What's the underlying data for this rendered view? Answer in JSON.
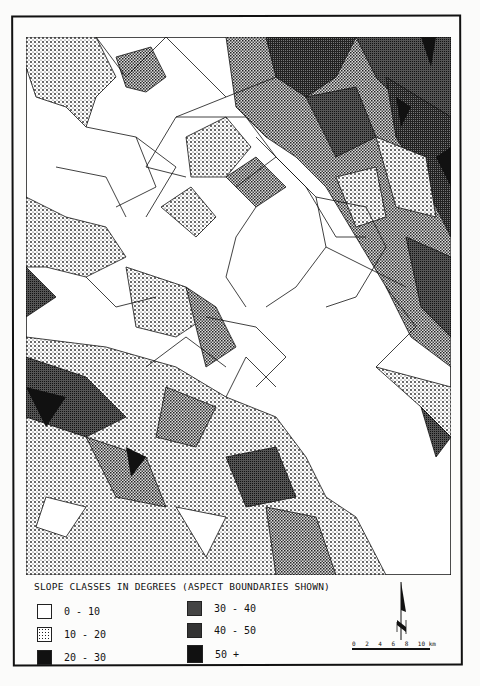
{
  "figure": {
    "type": "slope-class TIN map",
    "legend": {
      "title": "SLOPE CLASSES IN DEGREES",
      "subtitle": "(ASPECT BOUNDARIES SHOWN)",
      "classes": [
        {
          "label": "0 - 10",
          "pattern": "blank"
        },
        {
          "label": "10 - 20",
          "pattern": "light-dots"
        },
        {
          "label": "20 - 30",
          "pattern": "medium-dots"
        },
        {
          "label": "30 - 40",
          "pattern": "dense-dots"
        },
        {
          "label": "40 - 50",
          "pattern": "dark-crosshatch"
        },
        {
          "label": "50 +",
          "pattern": "solid-black"
        }
      ]
    },
    "north_arrow": {
      "icon": "north-arrow-icon"
    },
    "scale_bar": {
      "ticks": [
        "0",
        "2",
        "4",
        "6",
        "8",
        "10"
      ],
      "unit": "km"
    }
  },
  "colors": {
    "ink": "#111111",
    "paper": "#fbfbfa"
  }
}
